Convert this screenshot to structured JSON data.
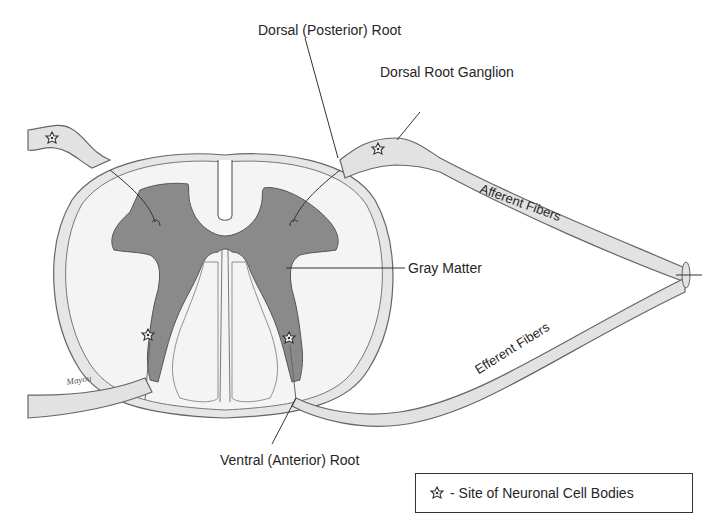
{
  "diagram": {
    "labels": {
      "dorsal_root": "Dorsal (Posterior) Root",
      "dorsal_root_ganglion": "Dorsal Root Ganglion",
      "afferent_fibers": "Afferent Fibers",
      "gray_matter": "Gray Matter",
      "efferent_fibers": "Efferent Fibers",
      "ventral_root": "Ventral (Anterior) Root"
    },
    "signature": "Mayou",
    "legend": {
      "icon": "neuron-cell-body-icon",
      "text": "- Site of Neuronal Cell Bodies"
    },
    "colors": {
      "gray_matter": "#8a8a8a",
      "white_matter": "#f4f4f4",
      "nerve_fill": "#e2e2e2",
      "outline": "#555555",
      "text": "#262626"
    }
  }
}
